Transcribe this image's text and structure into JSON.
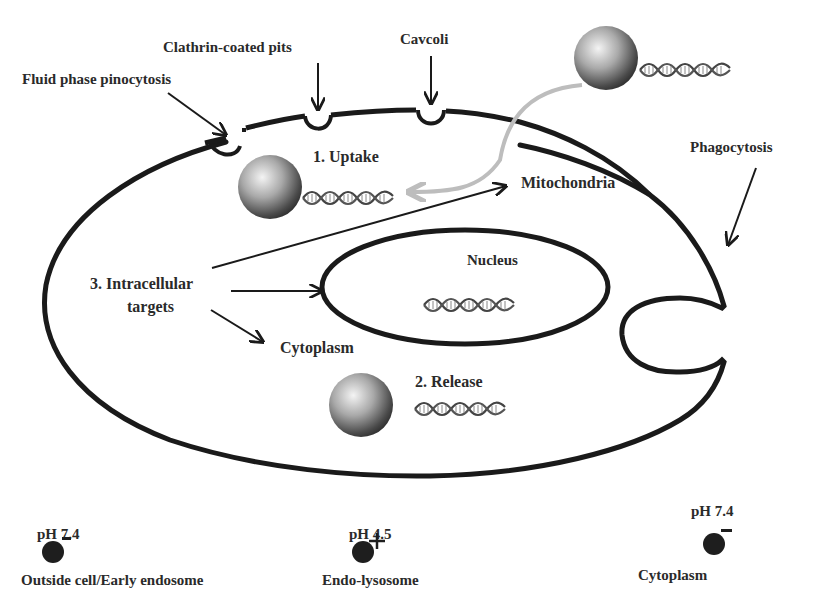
{
  "diagram": {
    "type": "cell-uptake-schematic",
    "uptake_labels": {
      "fluid_phase": "Fluid phase pinocytosis",
      "clathrin": "Clathrin-coated pits",
      "caveoli": "Cavcoli",
      "phagocytosis": "Phagocytosis"
    },
    "steps": {
      "uptake": "1. Uptake",
      "release": "2. Release",
      "targets_line1": "3. Intracellular",
      "targets_line2": "targets"
    },
    "organelles": {
      "mitochondria": "Mitochondria",
      "nucleus": "Nucleus",
      "cytoplasm": "Cytoplasm"
    },
    "ph_legend": [
      {
        "ph": "pH 7.4",
        "charge": "−",
        "location": "Outside cell/Early endosome"
      },
      {
        "ph": "pH 4.5",
        "charge": "+",
        "location": "Endo-lysosome"
      },
      {
        "ph": "pH 7.4",
        "charge": "−",
        "location": "Cytoplasm"
      }
    ],
    "colors": {
      "membrane": "#1a1a1a",
      "text": "#2a2a2a",
      "uptake_arrow": "#bdbdbd",
      "particle_light": "#f2f2f2",
      "particle_dark": "#3a3a3a"
    }
  }
}
